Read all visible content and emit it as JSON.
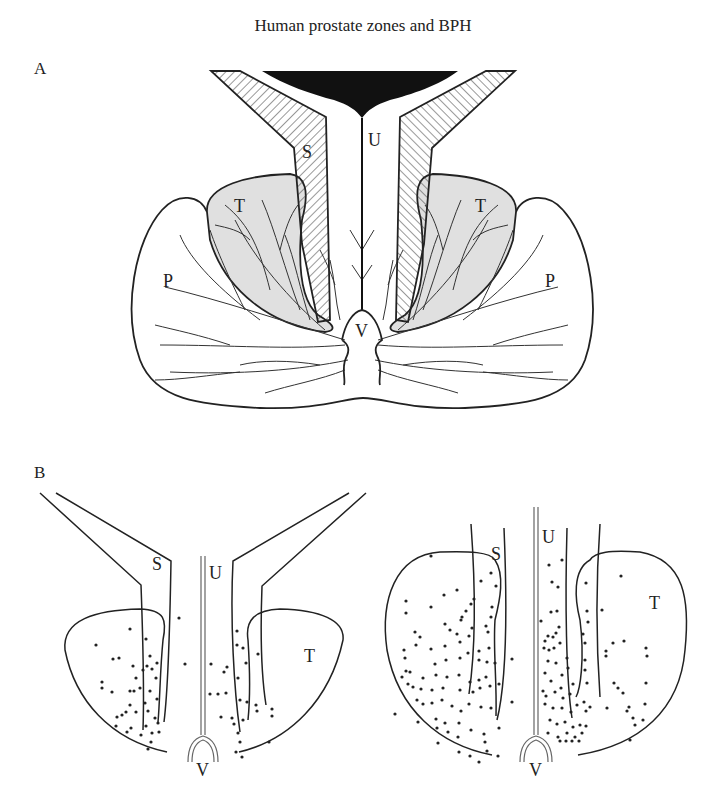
{
  "figure": {
    "title": "Human prostate zones and BPH",
    "panels": [
      {
        "id": "A",
        "label": "A",
        "zone_labels": {
          "urethra": "U",
          "stroma_left": "S",
          "transition_left": "T",
          "transition_right": "T",
          "peripheral_left": "P",
          "peripheral_right": "P",
          "verumontanum": "V"
        }
      },
      {
        "id": "B",
        "label": "B",
        "subpanels": [
          {
            "stage": "early",
            "zone_labels": {
              "stroma": "S",
              "urethra": "U",
              "transition": "T",
              "verumontanum": "V"
            }
          },
          {
            "stage": "advanced",
            "zone_labels": {
              "stroma": "S",
              "urethra": "U",
              "transition": "T",
              "verumontanum": "V"
            }
          }
        ]
      }
    ],
    "colors": {
      "line": "#222222",
      "transition_fill": "#e0e0e0",
      "preprostatic_sphincter": "#111111",
      "background": "#ffffff"
    }
  }
}
